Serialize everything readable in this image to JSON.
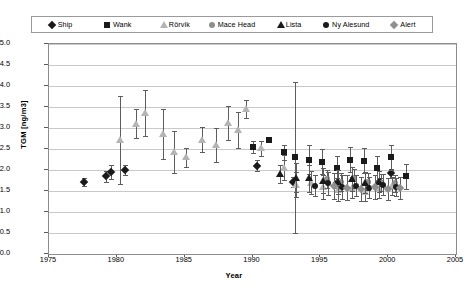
{
  "legend": {
    "position": "top",
    "items": [
      {
        "label": "Ship",
        "marker": "diamond",
        "color": "#1a1a1a",
        "key": "ship"
      },
      {
        "label": "Wank",
        "marker": "square",
        "color": "#1a1a1a",
        "key": "wank"
      },
      {
        "label": "Rörvik",
        "marker": "triangle",
        "color": "#b4b4b4",
        "key": "rorvik"
      },
      {
        "label": "Mace Head",
        "marker": "circle",
        "color": "#8f8f8f",
        "key": "macehead"
      },
      {
        "label": "Lista",
        "marker": "triangle",
        "color": "#1a1a1a",
        "key": "lista"
      },
      {
        "label": "Ny Alesund",
        "marker": "circle",
        "color": "#1a1a1a",
        "key": "nyalesund"
      },
      {
        "label": "Alert",
        "marker": "diamond",
        "color": "#8f8f8f",
        "key": "alert"
      }
    ]
  },
  "axes": {
    "y_label": "TGM [ng/m3]",
    "x_label": "Year",
    "y_ticks": [
      "0.0",
      "0.5",
      "1.0",
      "1.5",
      "2.0",
      "2.5",
      "3.0",
      "3.5",
      "4.0",
      "4.5",
      "5.0"
    ],
    "x_ticks": [
      "1975",
      "1980",
      "1985",
      "1990",
      "1995",
      "2000",
      "2005"
    ]
  },
  "chart_data": {
    "type": "scatter",
    "title": "",
    "xlabel": "Year",
    "ylabel": "TGM [ng/m3]",
    "xlim": [
      1975,
      2005
    ],
    "ylim": [
      0.0,
      5.0
    ],
    "ytick_step": 0.5,
    "xtick_step": 5,
    "grid": "horizontal",
    "legend_position": "top",
    "error_bars": "vertical",
    "series": [
      {
        "name": "Ship",
        "marker": "diamond",
        "color": "#1a1a1a",
        "points": [
          {
            "x": 1977.6,
            "y": 1.72,
            "err": 0.1
          },
          {
            "x": 1979.2,
            "y": 1.85,
            "err": 0.13
          },
          {
            "x": 1979.6,
            "y": 1.95,
            "err": 0.16
          },
          {
            "x": 1980.6,
            "y": 2.0,
            "err": 0.12
          },
          {
            "x": 1990.3,
            "y": 2.1,
            "err": 0.13
          },
          {
            "x": 1993.0,
            "y": 1.72,
            "err": 0.12
          },
          {
            "x": 1996.2,
            "y": 1.7,
            "err": 0.12
          },
          {
            "x": 1999.4,
            "y": 1.72,
            "err": 0.1
          },
          {
            "x": 2000.2,
            "y": 1.92,
            "err": 0.1
          }
        ]
      },
      {
        "name": "Wank",
        "marker": "square",
        "color": "#1a1a1a",
        "points": [
          {
            "x": 1990.0,
            "y": 2.55,
            "err": 0.14
          },
          {
            "x": 1991.2,
            "y": 2.72,
            "err": 0.0
          },
          {
            "x": 1992.3,
            "y": 2.42,
            "err": 0.18
          },
          {
            "x": 1993.1,
            "y": 2.3,
            "err": 1.8
          },
          {
            "x": 1994.2,
            "y": 2.25,
            "err": 0.35
          },
          {
            "x": 1995.1,
            "y": 2.2,
            "err": 0.3
          },
          {
            "x": 1996.2,
            "y": 2.05,
            "err": 0.28
          },
          {
            "x": 1997.2,
            "y": 2.25,
            "err": 0.3
          },
          {
            "x": 1998.2,
            "y": 2.22,
            "err": 0.3
          },
          {
            "x": 1999.2,
            "y": 2.05,
            "err": 0.28
          },
          {
            "x": 2000.2,
            "y": 2.3,
            "err": 0.3
          },
          {
            "x": 2001.3,
            "y": 1.85,
            "err": 0.3
          }
        ]
      },
      {
        "name": "Rörvik",
        "marker": "triangle",
        "color": "#b4b4b4",
        "points": [
          {
            "x": 1980.2,
            "y": 2.72,
            "err": 1.05
          },
          {
            "x": 1981.4,
            "y": 3.1,
            "err": 0.35
          },
          {
            "x": 1982.1,
            "y": 3.35,
            "err": 0.55
          },
          {
            "x": 1983.4,
            "y": 2.85,
            "err": 0.6
          },
          {
            "x": 1984.2,
            "y": 2.42,
            "err": 0.5
          },
          {
            "x": 1985.1,
            "y": 2.3,
            "err": 0.22
          },
          {
            "x": 1986.3,
            "y": 2.72,
            "err": 0.3
          },
          {
            "x": 1987.3,
            "y": 2.6,
            "err": 0.4
          },
          {
            "x": 1988.2,
            "y": 3.12,
            "err": 0.4
          },
          {
            "x": 1988.9,
            "y": 2.95,
            "err": 0.42
          },
          {
            "x": 1989.5,
            "y": 3.45,
            "err": 0.22
          },
          {
            "x": 1990.6,
            "y": 2.52,
            "err": 0.18
          },
          {
            "x": 1992.3,
            "y": 2.05,
            "err": 0.3
          },
          {
            "x": 1993.2,
            "y": 1.65,
            "err": 0.3
          },
          {
            "x": 1994.3,
            "y": 1.7,
            "err": 0.28
          },
          {
            "x": 1995.2,
            "y": 1.6,
            "err": 0.28
          },
          {
            "x": 1996.3,
            "y": 1.52,
            "err": 0.25
          },
          {
            "x": 1997.3,
            "y": 1.58,
            "err": 0.25
          },
          {
            "x": 1998.3,
            "y": 1.48,
            "err": 0.22
          },
          {
            "x": 1999.3,
            "y": 1.55,
            "err": 0.22
          },
          {
            "x": 2000.3,
            "y": 1.62,
            "err": 0.22
          }
        ]
      },
      {
        "name": "Mace Head",
        "marker": "circle",
        "color": "#8f8f8f",
        "points": [
          {
            "x": 1995.5,
            "y": 1.78,
            "err": 0.22
          },
          {
            "x": 1996.5,
            "y": 1.72,
            "err": 0.22
          },
          {
            "x": 1997.5,
            "y": 1.8,
            "err": 0.22
          },
          {
            "x": 1998.5,
            "y": 1.72,
            "err": 0.2
          },
          {
            "x": 1999.5,
            "y": 1.7,
            "err": 0.2
          },
          {
            "x": 2000.5,
            "y": 1.68,
            "err": 0.2
          }
        ]
      },
      {
        "name": "Lista",
        "marker": "triangle",
        "color": "#1a1a1a",
        "points": [
          {
            "x": 1992.0,
            "y": 1.9,
            "err": 0.22
          },
          {
            "x": 1993.2,
            "y": 1.82,
            "err": 0.35
          },
          {
            "x": 1994.2,
            "y": 1.8,
            "err": 0.32
          },
          {
            "x": 1995.2,
            "y": 1.75,
            "err": 0.3
          },
          {
            "x": 1996.3,
            "y": 1.72,
            "err": 0.28
          },
          {
            "x": 1997.3,
            "y": 1.78,
            "err": 0.28
          },
          {
            "x": 1998.3,
            "y": 1.7,
            "err": 0.25
          },
          {
            "x": 1999.3,
            "y": 1.72,
            "err": 0.25
          }
        ]
      },
      {
        "name": "Ny Alesund",
        "marker": "circle",
        "color": "#1a1a1a",
        "points": [
          {
            "x": 1994.6,
            "y": 1.62,
            "err": 0.25
          },
          {
            "x": 1995.6,
            "y": 1.68,
            "err": 0.28
          },
          {
            "x": 1996.6,
            "y": 1.6,
            "err": 0.28
          },
          {
            "x": 1997.6,
            "y": 1.62,
            "err": 0.25
          },
          {
            "x": 1998.6,
            "y": 1.58,
            "err": 0.25
          },
          {
            "x": 1999.6,
            "y": 1.65,
            "err": 0.25
          },
          {
            "x": 2000.6,
            "y": 1.6,
            "err": 0.22
          }
        ]
      },
      {
        "name": "Alert",
        "marker": "diamond",
        "color": "#8f8f8f",
        "points": [
          {
            "x": 1996.0,
            "y": 1.62,
            "err": 0.3
          },
          {
            "x": 1997.0,
            "y": 1.58,
            "err": 0.3
          },
          {
            "x": 1998.0,
            "y": 1.55,
            "err": 0.28
          },
          {
            "x": 1999.0,
            "y": 1.6,
            "err": 0.28
          },
          {
            "x": 2000.0,
            "y": 1.55,
            "err": 0.26
          },
          {
            "x": 2000.9,
            "y": 1.58,
            "err": 0.26
          }
        ]
      }
    ]
  }
}
